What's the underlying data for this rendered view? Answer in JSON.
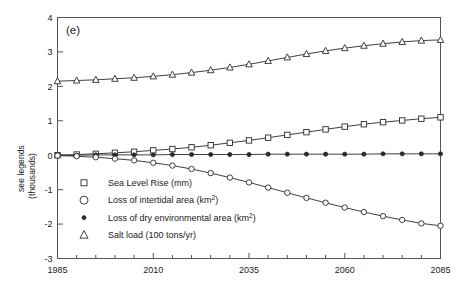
{
  "panel": {
    "label": "(e)"
  },
  "axes": {
    "ylabel_line1": "see legends",
    "ylabel_line2": "(thousands)",
    "xlabel": "",
    "ytick_labels": [
      "-3",
      "-2",
      "-1",
      "0",
      "1",
      "2",
      "3",
      "4"
    ],
    "xtick_labels": [
      "1985",
      "2010",
      "2035",
      "2060",
      "2085"
    ]
  },
  "legend": {
    "items": [
      {
        "marker": "open-square-icon",
        "label": "Sea Level Rise (mm)",
        "base": "Sea Level Rise (mm)",
        "sup": ""
      },
      {
        "marker": "open-circle-icon",
        "label": "Loss of intertidal area (km²)",
        "base": "Loss of intertidal area (km",
        "sup": "2"
      },
      {
        "marker": "filled-circle-icon",
        "label": "Loss of dry environmental area (km²)",
        "base": "Loss of dry environmental area (km",
        "sup": "2"
      },
      {
        "marker": "open-triangle-icon",
        "label": "Salt load (100 tons/yr)",
        "base": "Salt load (100 tons/yr)",
        "sup": ""
      }
    ]
  },
  "colors": {
    "line": "#2a2a2a",
    "axis": "#555555",
    "background": "#ffffff",
    "text": "#1a1a1a"
  },
  "chart_data": {
    "type": "line",
    "title": "(e)",
    "xlabel": "",
    "ylabel": "see legends (thousands)",
    "xlim": [
      1985,
      2085
    ],
    "ylim": [
      -3,
      4
    ],
    "ytick_values": [
      -3,
      -2,
      -1,
      0,
      1,
      2,
      3,
      4
    ],
    "xtick_values": [
      1985,
      2010,
      2035,
      2060,
      2085
    ],
    "minor_xtick_interval": 5,
    "grid": false,
    "legend_position": "lower-left-inside",
    "x": [
      1985,
      1990,
      1995,
      2000,
      2005,
      2010,
      2015,
      2020,
      2025,
      2030,
      2035,
      2040,
      2045,
      2050,
      2055,
      2060,
      2065,
      2070,
      2075,
      2080,
      2085
    ],
    "series": [
      {
        "name": "Salt load (100 tons/yr)",
        "marker": "open-triangle",
        "values": [
          2.15,
          2.17,
          2.19,
          2.22,
          2.25,
          2.29,
          2.34,
          2.4,
          2.47,
          2.55,
          2.64,
          2.74,
          2.84,
          2.94,
          3.03,
          3.11,
          3.18,
          3.24,
          3.29,
          3.33,
          3.35
        ]
      },
      {
        "name": "Sea Level Rise (mm)",
        "marker": "open-square",
        "values": [
          0.0,
          0.02,
          0.04,
          0.07,
          0.1,
          0.14,
          0.18,
          0.23,
          0.29,
          0.36,
          0.43,
          0.51,
          0.59,
          0.67,
          0.75,
          0.83,
          0.9,
          0.96,
          1.01,
          1.06,
          1.1
        ]
      },
      {
        "name": "Loss of dry environmental area (km²)",
        "marker": "filled-circle",
        "values": [
          0.0,
          0.0,
          0.01,
          0.01,
          0.01,
          0.01,
          0.02,
          0.02,
          0.02,
          0.02,
          0.02,
          0.03,
          0.03,
          0.03,
          0.03,
          0.03,
          0.03,
          0.04,
          0.04,
          0.04,
          0.04
        ]
      },
      {
        "name": "Loss of intertidal area (km²)",
        "marker": "open-circle",
        "values": [
          -0.01,
          -0.03,
          -0.06,
          -0.1,
          -0.15,
          -0.22,
          -0.3,
          -0.4,
          -0.52,
          -0.65,
          -0.79,
          -0.94,
          -1.09,
          -1.24,
          -1.38,
          -1.52,
          -1.65,
          -1.77,
          -1.88,
          -1.98,
          -2.05
        ]
      }
    ]
  }
}
